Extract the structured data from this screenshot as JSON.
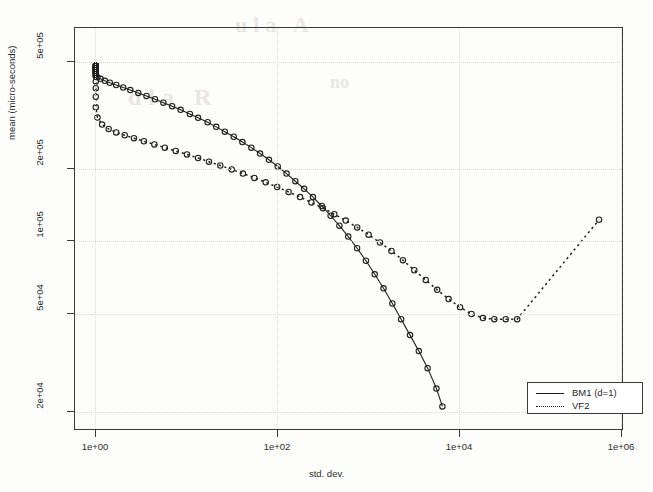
{
  "chart_data": {
    "type": "line",
    "title": "",
    "xlabel": "std. dev.",
    "ylabel": "mean (micro-seconds)",
    "xscale": "log",
    "yscale": "log",
    "grid": true,
    "legend_position": "bottom-right",
    "xlim": [
      0.55,
      4000000
    ],
    "ylim": [
      17000,
      800000
    ],
    "xticks": [
      1,
      100,
      10000,
      1000000
    ],
    "xticklabels": [
      "1e+00",
      "1e+02",
      "1e+04",
      "1e+06"
    ],
    "yticks": [
      20000,
      50000,
      100000,
      200000,
      500000
    ],
    "yticklabels": [
      "2e+04",
      "5e+04",
      "1e+05",
      "2e+05",
      "5e+05"
    ],
    "marker": "open-circle",
    "series": [
      {
        "name": "BM1 (d=1)",
        "linestyle": "solid",
        "color": "#1f1f1f",
        "x": [
          1.0,
          1.0,
          1.0,
          1.0,
          1.0,
          1.0,
          1.0,
          1.0,
          1.0,
          1.0,
          1.0,
          1.0,
          1.0,
          1.05,
          1.15,
          1.3,
          1.5,
          1.8,
          2.2,
          2.7,
          3.4,
          4.3,
          5.5,
          7.0,
          9.0,
          11.5,
          15,
          19,
          25,
          32,
          41,
          53,
          68,
          88,
          113,
          146,
          188,
          242,
          312,
          402,
          518,
          668,
          861,
          1110,
          1430,
          1845,
          2380,
          3065,
          3950,
          5090,
          6560,
          8460,
          10900,
          14050,
          18100,
          21500
        ],
        "y": [
          560000,
          556000,
          552000,
          548000,
          544000,
          540000,
          536000,
          532000,
          528000,
          524000,
          520000,
          514000,
          508000,
          500000,
          492000,
          483000,
          474000,
          464000,
          453000,
          442000,
          430000,
          418000,
          405000,
          392000,
          379000,
          366000,
          352000,
          339000,
          325000,
          311000,
          297000,
          283000,
          269000,
          255000,
          241000,
          227000,
          213000,
          199000,
          185000,
          172000,
          159000,
          146000,
          133000,
          121000,
          109000,
          97500,
          86500,
          76000,
          66500,
          57500,
          49500,
          42500,
          36500,
          31000,
          25500,
          21500
        ]
      },
      {
        "name": "VF2",
        "linestyle": "dashed",
        "color": "#1f1f1f",
        "x": [
          1.0,
          1.0,
          1.0,
          1.0,
          1.0,
          1.0,
          1.0,
          1.0,
          1.0,
          1.05,
          1.2,
          1.45,
          1.8,
          2.3,
          3.0,
          4.0,
          5.4,
          7.3,
          10.0,
          13.8,
          19,
          26,
          36,
          50,
          69,
          96,
          133,
          185,
          257,
          357,
          496,
          690,
          958,
          1330,
          1850,
          2570,
          3570,
          4960,
          6900,
          9580,
          13300,
          18500,
          25700,
          35700,
          49600,
          69000,
          95800,
          133000,
          185000,
          1950000
        ],
        "y": [
          560000,
          550000,
          540000,
          525000,
          505000,
          480000,
          450000,
          415000,
          375000,
          340000,
          318000,
          305000,
          295000,
          287000,
          279000,
          271000,
          263000,
          255000,
          247000,
          239000,
          231000,
          223000,
          215000,
          207000,
          199000,
          191000,
          183000,
          175000,
          167000,
          159000,
          151000,
          143000,
          135000,
          127000,
          119000,
          111000,
          103000,
          95000,
          87000,
          79000,
          72000,
          65500,
          60000,
          55500,
          52000,
          50000,
          49500,
          49500,
          49500,
          128000
        ]
      }
    ]
  },
  "axes": {
    "xlabel": "std. dev.",
    "ylabel": "mean (micro-seconds)",
    "xticklabels": [
      "1e+00",
      "1e+02",
      "1e+04",
      "1e+06"
    ],
    "yticklabels": [
      "5e+05",
      "2e+05",
      "1e+05",
      "5e+04",
      "2e+04"
    ]
  },
  "legend": {
    "entries": [
      {
        "label": "BM1 (d=1)",
        "style": "solid"
      },
      {
        "label": "VF2",
        "style": "dashed"
      }
    ]
  },
  "scan_artifacts": {
    "ghost_1": "ula A",
    "ghost_2": "dla R",
    "ghost_3": "no"
  }
}
